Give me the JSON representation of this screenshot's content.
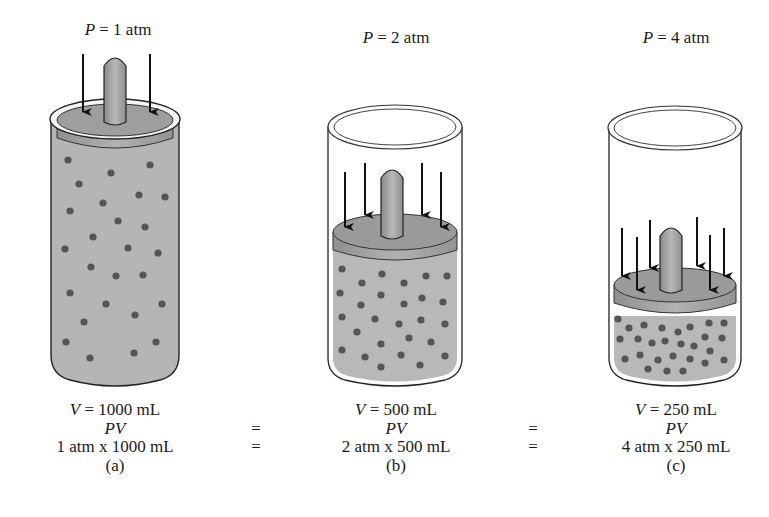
{
  "figure": {
    "colors": {
      "gas_fill": "#b4b4b4",
      "molecule": "#555555",
      "piston_top": "#9c9c9c",
      "piston_side": "#a8a8a8",
      "rod": "#a0a0a0",
      "outline": "#222222",
      "arrow": "#111111"
    },
    "panels": [
      {
        "id": "a",
        "pressure_var": "P",
        "pressure_text": " = 1 atm",
        "volume_var": "V",
        "volume_text": " = 1000 mL",
        "pv_label": "PV",
        "product": "1 atm x 1000 mL",
        "caption": "(a)",
        "arrows": 2,
        "piston_position": "top"
      },
      {
        "id": "b",
        "pressure_var": "P",
        "pressure_text": " = 2 atm",
        "volume_var": "V",
        "volume_text": " = 500 mL",
        "pv_label": "PV",
        "product": "2 atm x 500 mL",
        "caption": "(b)",
        "arrows": 4,
        "piston_position": "middle"
      },
      {
        "id": "c",
        "pressure_var": "P",
        "pressure_text": " = 4 atm",
        "volume_var": "V",
        "volume_text": " = 250 mL",
        "pv_label": "PV",
        "product": "4 atm x 250 mL",
        "caption": "(c)",
        "arrows": 6,
        "piston_position": "low"
      }
    ],
    "equals": [
      "=",
      "=",
      "=",
      "="
    ]
  }
}
